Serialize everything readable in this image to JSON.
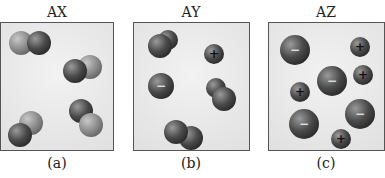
{
  "panels": [
    {
      "title": "AX",
      "label": "(a)",
      "description": "diatomic molecules, two-tone"
    },
    {
      "title": "AY",
      "label": "(b)",
      "description": "mostly diatomic molecules plus separate ions"
    },
    {
      "title": "AZ",
      "label": "(c)",
      "description": "fully dissociated ions"
    }
  ],
  "symbols": {
    "cation": "+",
    "anion": "−"
  }
}
